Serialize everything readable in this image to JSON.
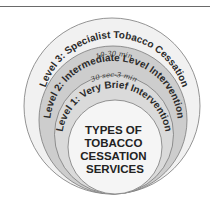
{
  "diagram": {
    "title": "TYPES OF TOBACCO CESSATION SERVICES",
    "center_lines": [
      "TYPES OF",
      "TOBACCO",
      "CESSATION",
      "SERVICES"
    ],
    "levels": [
      {
        "label": "Level 3: Specialist Tobacco Cessation",
        "duration": ""
      },
      {
        "label": "Level 2: Intermediate Level Intervention",
        "duration": "10-30 min"
      },
      {
        "label": "Level 1: Very Brief Intervention",
        "duration": "30 sec-3 min"
      }
    ],
    "colors": {
      "outer_band": "#f1f1f1",
      "level2_band": "#cdcdcd",
      "level1_band": "#dadada",
      "center": "#f5f5f5",
      "stroke": "#7a7a7a",
      "top_rule": "#6a6a6a"
    }
  }
}
